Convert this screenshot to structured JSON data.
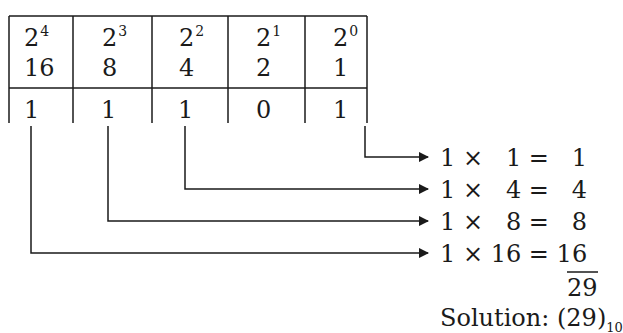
{
  "table": {
    "columns": [
      {
        "base": "2",
        "exponent": "4",
        "place_value": "16",
        "bit": "1"
      },
      {
        "base": "2",
        "exponent": "3",
        "place_value": "8",
        "bit": "1"
      },
      {
        "base": "2",
        "exponent": "2",
        "place_value": "4",
        "bit": "1"
      },
      {
        "base": "2",
        "exponent": "1",
        "place_value": "2",
        "bit": "0"
      },
      {
        "base": "2",
        "exponent": "0",
        "place_value": "1",
        "bit": "1"
      }
    ]
  },
  "products": [
    {
      "bit": "1",
      "times": "×",
      "place_value": "1",
      "equals": "=",
      "result": "1"
    },
    {
      "bit": "1",
      "times": "×",
      "place_value": "4",
      "equals": "=",
      "result": "4"
    },
    {
      "bit": "1",
      "times": "×",
      "place_value": "8",
      "equals": "=",
      "result": "8"
    },
    {
      "bit": "1",
      "times": "×",
      "place_value": "16",
      "equals": "=",
      "result": "16"
    }
  ],
  "sum": "29",
  "solution": {
    "label": "Solution:",
    "value": "(29)",
    "base": "10"
  }
}
